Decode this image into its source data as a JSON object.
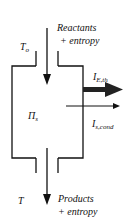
{
  "diagram": {
    "top_label_line1": "Reactants",
    "top_label_line2": "+ entropy",
    "top_temperature": "T",
    "top_temperature_sub": "o",
    "system_symbol": "Π",
    "system_sub": "s",
    "energy_flow_main": "I",
    "energy_flow_sub": "E,th",
    "entropy_flow_main": "I",
    "entropy_flow_sub": "s,cond",
    "bottom_temperature": "T",
    "bottom_label_line1": "Products",
    "bottom_label_line2": "+ entropy"
  }
}
